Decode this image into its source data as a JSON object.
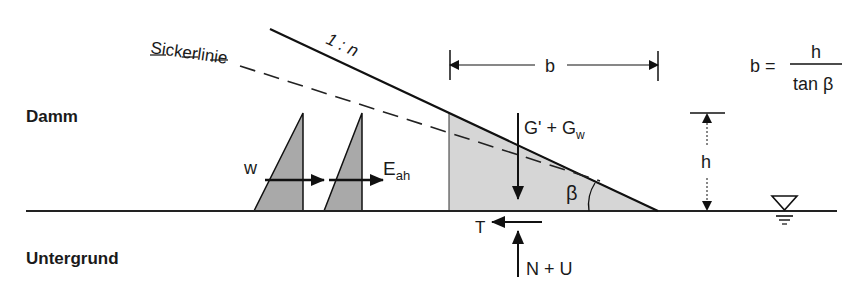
{
  "diagram": {
    "region_labels": {
      "embankment": "Damm",
      "subsoil": "Untergrund"
    },
    "seepage_line_label": "Sickerlinie",
    "slope_label": "1 : n",
    "dimension_b": "b",
    "dimension_h": "h",
    "formula": {
      "lhs": "b =",
      "numerator": "h",
      "denominator": "tan β"
    },
    "forces": {
      "weight": "G' + G",
      "weight_subscript": "w",
      "water_pressure": "w",
      "earth_pressure": "E",
      "earth_pressure_subscript": "ah",
      "friction": "T",
      "normal_uplift": "N + U"
    },
    "angle_label": "β",
    "colors": {
      "line": "#111111",
      "shade": "#d4d4d4",
      "triangle_fill": "#a8a8a8"
    }
  }
}
